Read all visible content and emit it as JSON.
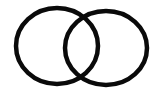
{
  "diagram": {
    "type": "two-overlapping-circles",
    "background": "#ffffff",
    "stroke_color": "#0a0a0a",
    "circles": [
      {
        "name": "left-circle",
        "cx": 57,
        "cy": 46,
        "rx": 41,
        "ry": 38,
        "stroke_width": 4.5
      },
      {
        "name": "right-circle",
        "cx": 106,
        "cy": 48,
        "rx": 41,
        "ry": 37,
        "stroke_width": 4.5
      }
    ]
  }
}
